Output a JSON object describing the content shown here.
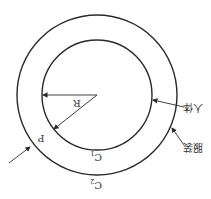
{
  "diagram": {
    "orientation": "rotated 180 degrees",
    "colors": {
      "line": "#2a2a2a",
      "text": "#333333",
      "background": "#ffffff"
    },
    "outer_circle": {
      "label": "C2",
      "label_main": "C",
      "label_sub": "2"
    },
    "inner_circle": {
      "label": "C1",
      "label_main": "C",
      "label_sub": "1"
    },
    "radius_label": "R",
    "point_label": "P",
    "annotations": {
      "body": "人体",
      "clothing": "服装"
    }
  }
}
